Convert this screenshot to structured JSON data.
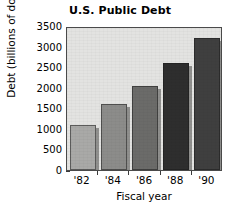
{
  "chart_data": {
    "type": "bar",
    "title": "U.S. Public Debt",
    "xlabel": "Fiscal year",
    "ylabel": "Debt (billions of dollars)",
    "categories": [
      "'82",
      "'84",
      "'86",
      "'88",
      "'90"
    ],
    "values": [
      1100,
      1600,
      2050,
      2600,
      3200
    ],
    "ylim": [
      0,
      3500
    ],
    "yticks": [
      0,
      500,
      1000,
      1500,
      2000,
      2500,
      3000,
      3500
    ],
    "ytick_labels": [
      "0",
      "500",
      "1000",
      "1500",
      "2000",
      "2500",
      "3000",
      "3500"
    ],
    "grid": false,
    "legend": null,
    "bar_colors": [
      "#a9a9a7",
      "#8c8c8a",
      "#6b6b69",
      "#2e2e2e",
      "#3f3f3f"
    ],
    "plot_background": "#e3e3e1",
    "axis_color": "#4a4a4a"
  },
  "figure": {
    "background": "#ffffff"
  }
}
